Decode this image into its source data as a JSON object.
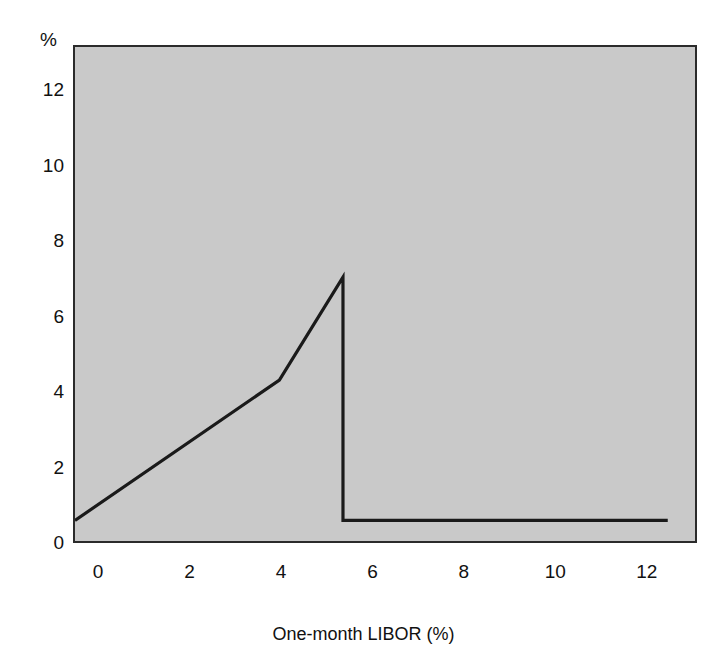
{
  "figure": {
    "background_color": "#ffffff",
    "plot_fill_color": "#c9c9c9",
    "line_color": "#1a1a1a",
    "border_color": "#2b2b2b"
  },
  "chart_data": {
    "type": "line",
    "title": "",
    "subtitle": "",
    "xlabel": "One-month  LIBOR (%)",
    "ylabel": "",
    "y_unit_label": "%",
    "xlim": [
      -0.55,
      13.1
    ],
    "ylim": [
      0,
      13.2
    ],
    "xticks": [
      0,
      2,
      4,
      6,
      8,
      10,
      12
    ],
    "xticklabels": [
      "0",
      "2",
      "4",
      "6",
      "8",
      "10",
      "12"
    ],
    "yticks": [
      0,
      2,
      4,
      6,
      8,
      10,
      12
    ],
    "yticklabels": [
      "0",
      "2",
      "4",
      "6",
      "8",
      "10",
      "12"
    ],
    "grid": false,
    "legend": null,
    "annotations": [],
    "series": [
      {
        "name": "Payoff",
        "color": "#1a1a1a",
        "linewidth": 3,
        "x": [
          -0.55,
          3.95,
          5.35,
          5.35,
          12.5
        ],
        "y": [
          0.55,
          4.3,
          7.05,
          0.55,
          0.55
        ]
      }
    ]
  },
  "axis": {
    "y_unit": "%",
    "x_title": "One-month  LIBOR (%)"
  }
}
